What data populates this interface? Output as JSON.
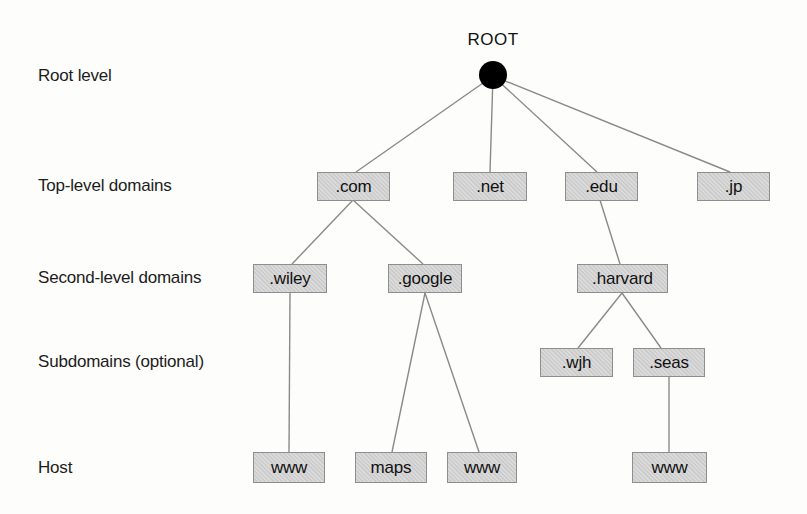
{
  "row_labels": {
    "root": "Root level",
    "tld": "Top-level domains",
    "second": "Second-level domains",
    "sub": "Subdomains (optional)",
    "host": "Host"
  },
  "root_node": {
    "label": "ROOT"
  },
  "nodes": {
    "com": {
      "label": ".com",
      "level": "Top-level domains",
      "parent": "ROOT"
    },
    "net": {
      "label": ".net",
      "level": "Top-level domains",
      "parent": "ROOT"
    },
    "edu": {
      "label": ".edu",
      "level": "Top-level domains",
      "parent": "ROOT"
    },
    "jp": {
      "label": ".jp",
      "level": "Top-level domains",
      "parent": "ROOT"
    },
    "wiley": {
      "label": ".wiley",
      "level": "Second-level domains",
      "parent": ".com"
    },
    "google": {
      "label": ".google",
      "level": "Second-level domains",
      "parent": ".com"
    },
    "harvard": {
      "label": ".harvard",
      "level": "Second-level domains",
      "parent": ".edu"
    },
    "wjh": {
      "label": ".wjh",
      "level": "Subdomains (optional)",
      "parent": ".harvard"
    },
    "seas": {
      "label": ".seas",
      "level": "Subdomains (optional)",
      "parent": ".harvard"
    },
    "www_wiley": {
      "label": "www",
      "level": "Host",
      "parent": ".wiley"
    },
    "maps": {
      "label": "maps",
      "level": "Host",
      "parent": ".google"
    },
    "www_google": {
      "label": "www",
      "level": "Host",
      "parent": ".google"
    },
    "www_seas": {
      "label": "www",
      "level": "Host",
      "parent": ".seas"
    }
  },
  "colors": {
    "box_fill": "#d3d3d3",
    "box_border": "#8e8e8e",
    "edge_line": "#8a8a8a",
    "root_dot": "#000000",
    "text": "#111111",
    "background": "#fdfdfb"
  }
}
